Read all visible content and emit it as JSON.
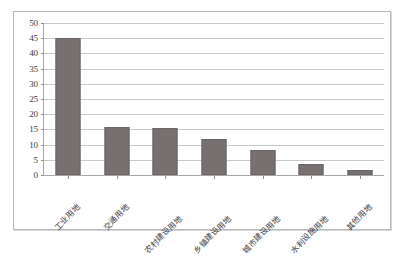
{
  "chart_data": {
    "type": "bar",
    "title": "",
    "subtitle": "",
    "xlabel": "",
    "ylabel": "",
    "ylim": [
      0,
      50
    ],
    "ytick_step": 5,
    "yticks": [
      "50",
      "45",
      "40",
      "35",
      "30",
      "25",
      "20",
      "15",
      "10",
      "5",
      "0"
    ],
    "grid": true,
    "legend": false,
    "bar_color": "#767070",
    "gridline_color": "#c8c8c8",
    "axis_color": "#a6a6a6",
    "categories": [
      "工业用地",
      "交通用地",
      "农村建设用地",
      "乡镇建设用地",
      "城市建设用地",
      "水利设施用地",
      "其他用地"
    ],
    "values": [
      45.0,
      15.8,
      15.6,
      11.7,
      8.2,
      3.5,
      1.5
    ]
  }
}
